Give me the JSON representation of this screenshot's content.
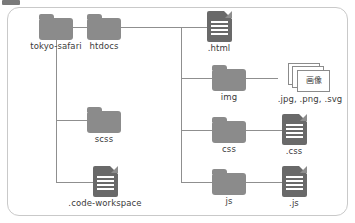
{
  "diagram": {
    "colors": {
      "folder": "#8b8b8b",
      "file": "#696969",
      "line": "#8f8f8f",
      "border": "#c9c9c9",
      "label": "#3b3b3b"
    },
    "nodes": [
      {
        "id": "tokyo-safari",
        "label": "tokyo-safari",
        "icon": "folder-icon"
      },
      {
        "id": "htdocs",
        "label": "htdocs",
        "icon": "folder-icon"
      },
      {
        "id": "scss",
        "label": "scss",
        "icon": "folder-icon"
      },
      {
        "id": "code-workspace",
        "label": ".code-workspace",
        "icon": "file-icon"
      },
      {
        "id": "html",
        "label": ".html",
        "icon": "file-icon"
      },
      {
        "id": "img",
        "label": "img",
        "icon": "folder-icon"
      },
      {
        "id": "images",
        "label": ".jpg, .png, .svg",
        "icon": "image-stack-icon",
        "card_label": "画像"
      },
      {
        "id": "css",
        "label": "css",
        "icon": "folder-icon"
      },
      {
        "id": "css-file",
        "label": ".css",
        "icon": "file-icon"
      },
      {
        "id": "js",
        "label": "js",
        "icon": "folder-icon"
      },
      {
        "id": "js-file",
        "label": ".js",
        "icon": "file-icon"
      }
    ]
  }
}
